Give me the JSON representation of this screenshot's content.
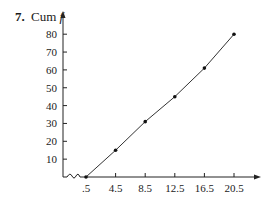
{
  "figure": {
    "problem_number": "7.",
    "y_title_prefix": "Cum",
    "y_title_var": "f"
  },
  "chart_data": {
    "type": "line",
    "title": "",
    "xlabel": "",
    "ylabel": "Cum f",
    "x": [
      0.5,
      4.5,
      8.5,
      12.5,
      16.5,
      20.5
    ],
    "x_tick_labels": [
      ".5",
      "4.5",
      "8.5",
      "12.5",
      "16.5",
      "20.5"
    ],
    "y_ticks": [
      10,
      20,
      30,
      40,
      50,
      60,
      70,
      80
    ],
    "y_tick_labels": [
      "10",
      "20",
      "30",
      "40",
      "50",
      "60",
      "70",
      "80"
    ],
    "series": [
      {
        "name": "Cumulative frequency",
        "values": [
          0,
          15,
          31,
          45,
          61,
          80
        ]
      }
    ],
    "xlim": [
      0.5,
      22
    ],
    "ylim": [
      0,
      85
    ],
    "grid": false,
    "legend": "none",
    "axis_break": "x-axis break near origin",
    "markers": true
  }
}
